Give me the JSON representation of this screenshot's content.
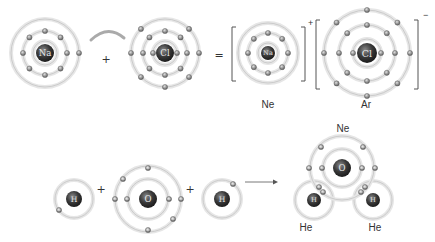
{
  "colors": {
    "shell": "#d9d9d9",
    "shell_edge": "#c4c4c4",
    "electron": "#8a8a8a",
    "nucleus": "#3a3a3a",
    "nucleus_light": "#555555",
    "text": "#333333",
    "bracket": "#555555"
  },
  "reaction1": {
    "title": "Ionic bond formation: sodium chloride",
    "atoms": [
      {
        "id": "na",
        "symbol": "Na",
        "cx": 45,
        "cy": 53,
        "shells": [
          12,
          22,
          34
        ],
        "electrons": [
          0,
          8,
          1
        ],
        "nucleus_r": 9
      },
      {
        "id": "cl",
        "symbol": "Cl",
        "cx": 165,
        "cy": 53,
        "shells": [
          12,
          22,
          34
        ],
        "electrons": [
          2,
          8,
          7
        ],
        "nucleus_r": 9
      },
      {
        "id": "na-ion",
        "symbol": "Na",
        "cx": 268,
        "cy": 53,
        "shells": [
          10,
          20,
          30
        ],
        "electrons": [
          0,
          8,
          0
        ],
        "nucleus_r": 7
      },
      {
        "id": "cl-ion",
        "symbol": "Cl",
        "cx": 367,
        "cy": 53,
        "shells": [
          14,
          28,
          43
        ],
        "electrons": [
          2,
          8,
          8
        ],
        "nucleus_r": 10
      }
    ],
    "operators": [
      {
        "symbol": "+",
        "x": 106,
        "y": 59
      },
      {
        "symbol": "=",
        "x": 219,
        "y": 55
      }
    ],
    "ion_charges": [
      {
        "symbol": "+",
        "x": 308,
        "y": 26
      },
      {
        "symbol": "−",
        "x": 423,
        "y": 18
      }
    ],
    "labels": [
      {
        "text": "Ne",
        "x": 268,
        "y": 99
      },
      {
        "text": "Ar",
        "x": 366,
        "y": 99
      }
    ]
  },
  "reaction2": {
    "title": "Covalent bond formation: water",
    "atoms": [
      {
        "id": "h1",
        "symbol": "H",
        "cx": 74,
        "cy": 199,
        "shells": [
          19
        ],
        "electrons": [
          1
        ],
        "nucleus_r": 8
      },
      {
        "id": "o",
        "symbol": "O",
        "cx": 148,
        "cy": 199,
        "shells": [
          20,
          33
        ],
        "electrons": [
          2,
          6
        ],
        "nucleus_r": 9
      },
      {
        "id": "h2",
        "symbol": "H",
        "cx": 222,
        "cy": 199,
        "shells": [
          19
        ],
        "electrons": [
          1
        ],
        "nucleus_r": 8
      }
    ],
    "operators": [
      {
        "symbol": "+",
        "x": 101,
        "y": 189
      },
      {
        "symbol": "+",
        "x": 190,
        "y": 189
      }
    ],
    "arrow": {
      "x1": 245,
      "y1": 182,
      "x2": 278,
      "y2": 182
    },
    "product": {
      "o": {
        "symbol": "O",
        "cx": 342,
        "cy": 168,
        "shells": [
          19,
          32
        ],
        "nucleus_r": 9
      },
      "h_left": {
        "symbol": "H",
        "cx": 314,
        "cy": 200,
        "shell": 19,
        "nucleus_r": 7
      },
      "h_right": {
        "symbol": "H",
        "cx": 373,
        "cy": 200,
        "shell": 19,
        "nucleus_r": 7
      }
    },
    "labels": [
      {
        "text": "Ne",
        "x": 343,
        "y": 123
      },
      {
        "text": "He",
        "x": 306,
        "y": 222
      },
      {
        "text": "He",
        "x": 375,
        "y": 222
      }
    ]
  }
}
